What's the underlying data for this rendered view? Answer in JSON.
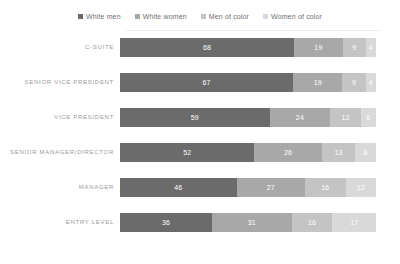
{
  "chart_data": {
    "type": "bar",
    "orientation": "horizontal",
    "stacked": true,
    "title": "",
    "subtitle": "",
    "xlabel": "",
    "ylabel": "",
    "grid": false,
    "legend_position": "top",
    "xlim": [
      0,
      100
    ],
    "categories": [
      "C-SUITE",
      "SENIOR VICE PRESIDENT",
      "VICE PRESIDENT",
      "SENIOR MANAGER/DIRECTOR",
      "MANAGER",
      "ENTRY LEVEL"
    ],
    "series": [
      {
        "name": "White men",
        "color": "#6b6b6b",
        "values": [
          68,
          67,
          59,
          52,
          46,
          36
        ]
      },
      {
        "name": "White women",
        "color": "#a8a8a8",
        "values": [
          19,
          19,
          24,
          26,
          27,
          31
        ]
      },
      {
        "name": "Men of color",
        "color": "#c4c4c4",
        "values": [
          9,
          9,
          12,
          13,
          16,
          16
        ]
      },
      {
        "name": "Women of color",
        "color": "#d9d9d9",
        "values": [
          4,
          4,
          6,
          8,
          12,
          17
        ]
      }
    ]
  },
  "legend": {
    "items": [
      {
        "label": "White men",
        "color": "#6b6b6b"
      },
      {
        "label": "White women",
        "color": "#a8a8a8"
      },
      {
        "label": "Men of color",
        "color": "#c4c4c4"
      },
      {
        "label": "Women of color",
        "color": "#d9d9d9"
      }
    ]
  },
  "colors": {
    "background": "#ffffff",
    "label_text": "#9a9a9a",
    "legend_text": "#6e6e6e",
    "value_text": "#ffffff",
    "axis_line": "#ededed"
  }
}
